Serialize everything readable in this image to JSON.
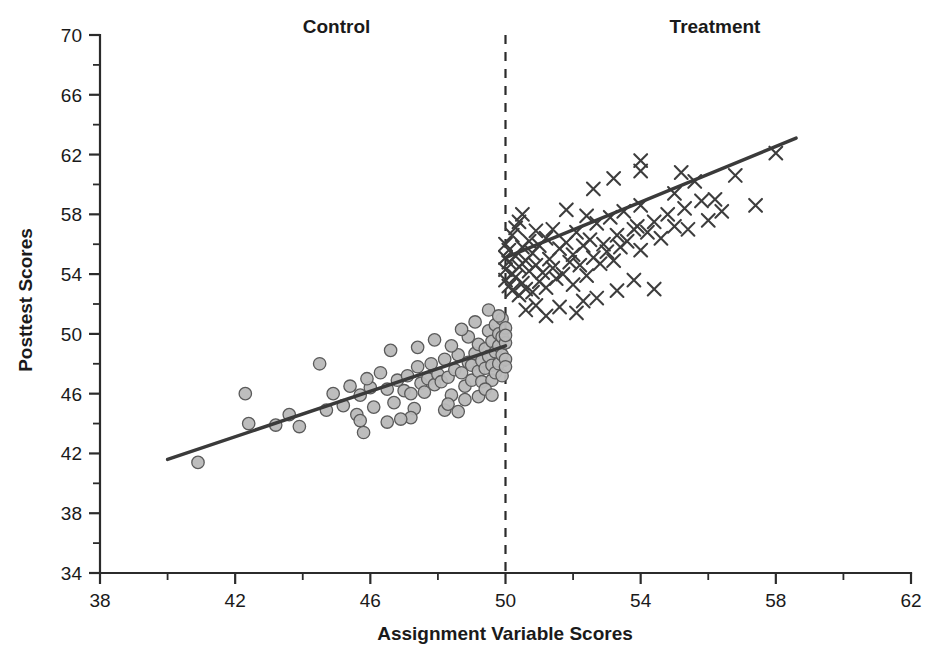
{
  "chart_data": {
    "type": "scatter",
    "title": "",
    "xlabel": "Assignment Variable Scores",
    "ylabel": "Posttest Scores",
    "xlim": [
      38,
      62
    ],
    "ylim": [
      34,
      70
    ],
    "xticks": [
      38,
      42,
      46,
      50,
      54,
      58,
      62
    ],
    "yticks": [
      34,
      38,
      42,
      46,
      50,
      54,
      58,
      62,
      66,
      70
    ],
    "xtick_labels": [
      "38",
      "42",
      "46",
      "50",
      "54",
      "58",
      "62"
    ],
    "ytick_labels": [
      "34",
      "38",
      "42",
      "46",
      "50",
      "54",
      "58",
      "62",
      "66",
      "70"
    ],
    "minor_tick_step": 2,
    "grid": false,
    "legend_position": "none",
    "annotations": [
      {
        "name": "control-label",
        "text": "Control",
        "x": 45.0,
        "y": 70.6
      },
      {
        "name": "treatment-label",
        "text": "Treatment",
        "x": 56.2,
        "y": 70.6
      }
    ],
    "cutoff": {
      "x": 50,
      "style": "dashed",
      "label": ""
    },
    "series": [
      {
        "name": "Control",
        "marker": "circle",
        "color": "#b9b9b9",
        "edge_color": "#5a5a5a",
        "points": [
          [
            40.9,
            41.4
          ],
          [
            42.3,
            46.0
          ],
          [
            42.4,
            44.0
          ],
          [
            43.6,
            44.6
          ],
          [
            43.9,
            43.8
          ],
          [
            44.5,
            48.0
          ],
          [
            44.7,
            44.9
          ],
          [
            45.2,
            45.2
          ],
          [
            45.4,
            46.5
          ],
          [
            45.6,
            44.6
          ],
          [
            45.7,
            45.9
          ],
          [
            45.7,
            44.2
          ],
          [
            45.8,
            43.4
          ],
          [
            46.0,
            46.4
          ],
          [
            46.1,
            45.1
          ],
          [
            46.3,
            47.4
          ],
          [
            46.5,
            46.3
          ],
          [
            46.7,
            45.4
          ],
          [
            46.8,
            46.9
          ],
          [
            47.0,
            46.2
          ],
          [
            47.1,
            47.2
          ],
          [
            47.2,
            46.0
          ],
          [
            47.3,
            45.0
          ],
          [
            47.4,
            47.8
          ],
          [
            47.5,
            46.7
          ],
          [
            47.6,
            46.1
          ],
          [
            47.7,
            47.0
          ],
          [
            47.8,
            48.0
          ],
          [
            47.9,
            46.6
          ],
          [
            48.0,
            47.3
          ],
          [
            48.1,
            46.8
          ],
          [
            48.2,
            48.3
          ],
          [
            48.3,
            47.1
          ],
          [
            48.4,
            45.9
          ],
          [
            48.5,
            47.6
          ],
          [
            48.6,
            48.6
          ],
          [
            48.7,
            47.4
          ],
          [
            48.8,
            46.5
          ],
          [
            48.9,
            48.1
          ],
          [
            49.0,
            47.9
          ],
          [
            49.0,
            46.9
          ],
          [
            49.1,
            48.7
          ],
          [
            49.2,
            47.5
          ],
          [
            49.2,
            49.3
          ],
          [
            49.3,
            48.2
          ],
          [
            49.3,
            46.8
          ],
          [
            49.4,
            49.0
          ],
          [
            49.4,
            47.7
          ],
          [
            49.5,
            48.5
          ],
          [
            49.5,
            50.2
          ],
          [
            49.6,
            47.9
          ],
          [
            49.6,
            49.5
          ],
          [
            49.6,
            46.9
          ],
          [
            49.7,
            48.8
          ],
          [
            49.7,
            50.6
          ],
          [
            49.7,
            47.4
          ],
          [
            49.8,
            49.2
          ],
          [
            49.8,
            48.0
          ],
          [
            49.8,
            50.0
          ],
          [
            49.9,
            48.6
          ],
          [
            49.9,
            49.8
          ],
          [
            49.9,
            47.2
          ],
          [
            49.9,
            51.0
          ],
          [
            50.0,
            49.4
          ],
          [
            50.0,
            48.3
          ],
          [
            50.0,
            50.4
          ],
          [
            50.0,
            47.8
          ],
          [
            50.0,
            49.9
          ],
          [
            49.5,
            51.6
          ],
          [
            49.8,
            51.2
          ],
          [
            48.9,
            49.8
          ],
          [
            48.4,
            49.2
          ],
          [
            47.9,
            49.6
          ],
          [
            48.7,
            50.3
          ],
          [
            49.1,
            50.8
          ],
          [
            46.6,
            48.9
          ],
          [
            47.4,
            49.1
          ],
          [
            48.2,
            44.9
          ],
          [
            48.3,
            45.3
          ],
          [
            47.2,
            44.4
          ],
          [
            46.9,
            44.3
          ],
          [
            46.5,
            44.1
          ],
          [
            45.9,
            47.0
          ],
          [
            44.9,
            46.0
          ],
          [
            43.2,
            43.9
          ],
          [
            49.2,
            45.8
          ],
          [
            49.4,
            46.3
          ],
          [
            48.6,
            44.8
          ],
          [
            48.8,
            45.6
          ],
          [
            49.6,
            45.9
          ]
        ]
      },
      {
        "name": "Treatment",
        "marker": "x",
        "color": "#3d3d3d",
        "points": [
          [
            50.0,
            55.1
          ],
          [
            50.0,
            54.3
          ],
          [
            50.0,
            53.6
          ],
          [
            50.0,
            56.0
          ],
          [
            50.1,
            54.8
          ],
          [
            50.1,
            53.2
          ],
          [
            50.1,
            55.6
          ],
          [
            50.2,
            54.0
          ],
          [
            50.2,
            56.6
          ],
          [
            50.2,
            52.9
          ],
          [
            50.3,
            55.2
          ],
          [
            50.3,
            53.8
          ],
          [
            50.3,
            57.1
          ],
          [
            50.4,
            54.5
          ],
          [
            50.4,
            52.6
          ],
          [
            50.5,
            55.8
          ],
          [
            50.5,
            53.4
          ],
          [
            50.5,
            58.0
          ],
          [
            50.6,
            54.9
          ],
          [
            50.6,
            53.0
          ],
          [
            50.7,
            56.2
          ],
          [
            50.7,
            54.2
          ],
          [
            50.8,
            55.4
          ],
          [
            50.8,
            52.8
          ],
          [
            50.9,
            56.9
          ],
          [
            50.9,
            54.6
          ],
          [
            51.0,
            53.5
          ],
          [
            51.0,
            55.9
          ],
          [
            51.1,
            54.1
          ],
          [
            51.2,
            56.4
          ],
          [
            51.2,
            53.1
          ],
          [
            51.3,
            55.0
          ],
          [
            51.4,
            57.0
          ],
          [
            51.4,
            54.4
          ],
          [
            51.5,
            53.7
          ],
          [
            51.6,
            55.7
          ],
          [
            51.7,
            54.0
          ],
          [
            51.8,
            56.1
          ],
          [
            51.9,
            54.8
          ],
          [
            52.0,
            53.3
          ],
          [
            52.0,
            55.3
          ],
          [
            52.1,
            56.8
          ],
          [
            52.2,
            54.6
          ],
          [
            52.3,
            55.9
          ],
          [
            52.4,
            53.9
          ],
          [
            52.5,
            56.3
          ],
          [
            52.6,
            55.1
          ],
          [
            52.7,
            57.4
          ],
          [
            52.8,
            54.7
          ],
          [
            52.9,
            56.0
          ],
          [
            53.0,
            55.5
          ],
          [
            53.1,
            57.8
          ],
          [
            53.2,
            54.9
          ],
          [
            53.3,
            56.6
          ],
          [
            53.4,
            55.8
          ],
          [
            53.5,
            58.2
          ],
          [
            53.6,
            56.2
          ],
          [
            53.8,
            57.0
          ],
          [
            54.0,
            55.6
          ],
          [
            54.0,
            58.6
          ],
          [
            54.2,
            56.8
          ],
          [
            54.4,
            57.5
          ],
          [
            54.6,
            56.4
          ],
          [
            54.8,
            58.0
          ],
          [
            55.0,
            57.2
          ],
          [
            55.2,
            60.8
          ],
          [
            55.3,
            58.4
          ],
          [
            55.4,
            57.0
          ],
          [
            55.6,
            60.2
          ],
          [
            55.8,
            58.9
          ],
          [
            56.0,
            57.6
          ],
          [
            56.4,
            58.2
          ],
          [
            56.8,
            60.6
          ],
          [
            57.4,
            58.6
          ],
          [
            58.0,
            62.1
          ],
          [
            50.9,
            51.9
          ],
          [
            51.6,
            51.8
          ],
          [
            52.3,
            52.2
          ],
          [
            52.1,
            51.4
          ],
          [
            53.3,
            52.9
          ],
          [
            53.8,
            53.6
          ],
          [
            54.4,
            53.0
          ],
          [
            51.2,
            51.2
          ],
          [
            50.6,
            51.6
          ],
          [
            52.7,
            52.4
          ],
          [
            54.0,
            60.9
          ],
          [
            54.0,
            61.6
          ],
          [
            53.2,
            60.4
          ],
          [
            52.6,
            59.7
          ],
          [
            55.0,
            59.4
          ],
          [
            56.2,
            59.0
          ],
          [
            51.8,
            58.3
          ],
          [
            52.4,
            57.9
          ],
          [
            50.4,
            57.5
          ],
          [
            53.9,
            57.2
          ]
        ]
      }
    ],
    "fit_lines": [
      {
        "name": "control-fit",
        "group": "Control",
        "x_start": 40.0,
        "y_start": 41.6,
        "x_end": 50.0,
        "y_end": 49.2
      },
      {
        "name": "treatment-fit",
        "group": "Treatment",
        "x_start": 50.0,
        "y_start": 55.1,
        "x_end": 58.6,
        "y_end": 63.1
      }
    ],
    "discontinuity_jump": 5.9
  },
  "colors": {
    "axis": "#2b2b2b",
    "line": "#3a3a3a",
    "control_fill": "#b9b9b9",
    "control_edge": "#5a5a5a",
    "treatment": "#3d3d3d",
    "background": "#ffffff"
  }
}
